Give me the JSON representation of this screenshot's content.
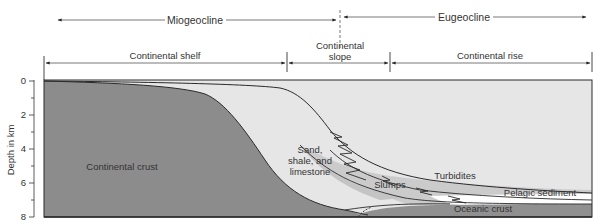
{
  "header": {
    "miogeocline": "Miogeocline",
    "eugeocline": "Eugeocline"
  },
  "zones": {
    "continental_shelf": "Continental shelf",
    "continental_slope_line1": "Continental",
    "continental_slope_line2": "slope",
    "continental_rise": "Continental rise"
  },
  "axis": {
    "label": "Depth in km",
    "ticks": [
      "0",
      "2",
      "4",
      "6",
      "8"
    ]
  },
  "layers": {
    "continental_crust": "Continental crust",
    "sediments_line1": "Sand,",
    "sediments_line2": "shale, and",
    "sediments_line3": "limestone",
    "slumps": "Slumps",
    "turbidites": "Turbidites",
    "pelagic_sediment": "Pelagic sediment",
    "oceanic_crust": "Oceanic crust"
  },
  "colors": {
    "continental_crust": "#8c8c8c",
    "sediments": "#e6e6e6",
    "slumps_turbidites": "#c8c8c8",
    "pelagic": "#ffffff",
    "oceanic_crust": "#8f8f8f",
    "line": "#2a2a2a"
  }
}
